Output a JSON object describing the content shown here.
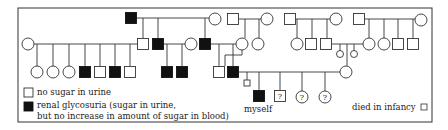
{
  "diagram": {
    "type": "pedigree",
    "trait": "renal glycosuria",
    "colors": {
      "line": "#333333",
      "affected_fill": "#111111",
      "unaffected_fill": "#ffffff",
      "background": "#ffffff"
    },
    "frame": {
      "x": 18,
      "y": 8,
      "width": 414,
      "height": 114
    },
    "symbols": [
      {
        "id": "g1-m1",
        "shape": "square",
        "affected": true,
        "x": 131,
        "y": 18
      },
      {
        "id": "g1-f1",
        "shape": "circle",
        "affected": false,
        "x": 215,
        "y": 19
      },
      {
        "id": "g1-m2",
        "shape": "square",
        "affected": false,
        "x": 233,
        "y": 19
      },
      {
        "id": "g1-f2",
        "shape": "circle",
        "affected": false,
        "x": 267,
        "y": 19
      },
      {
        "id": "g1-m3",
        "shape": "square",
        "affected": false,
        "x": 290,
        "y": 19
      },
      {
        "id": "g1-f3",
        "shape": "circle",
        "affected": false,
        "x": 336,
        "y": 19
      },
      {
        "id": "g1-m4",
        "shape": "square",
        "affected": false,
        "x": 359,
        "y": 19
      },
      {
        "id": "g1-f4",
        "shape": "circle",
        "affected": false,
        "x": 421,
        "y": 20
      },
      {
        "id": "g2-f1",
        "shape": "circle",
        "affected": false,
        "x": 28,
        "y": 44
      },
      {
        "id": "g2-m1",
        "shape": "square",
        "affected": false,
        "x": 143,
        "y": 44
      },
      {
        "id": "g2-m2",
        "shape": "square",
        "affected": true,
        "x": 158,
        "y": 44
      },
      {
        "id": "g2-f2",
        "shape": "circle",
        "affected": false,
        "x": 191,
        "y": 44
      },
      {
        "id": "g2-m3",
        "shape": "square",
        "affected": true,
        "x": 205,
        "y": 44
      },
      {
        "id": "g2-f3",
        "shape": "circle",
        "affected": false,
        "x": 242,
        "y": 44
      },
      {
        "id": "g2-f4",
        "shape": "circle",
        "affected": false,
        "x": 258,
        "y": 44
      },
      {
        "id": "g2-f5",
        "shape": "circle",
        "affected": false,
        "x": 297,
        "y": 44
      },
      {
        "id": "g2-m4",
        "shape": "square",
        "affected": false,
        "x": 311,
        "y": 44
      },
      {
        "id": "g2-m5",
        "shape": "square",
        "affected": false,
        "x": 326,
        "y": 44
      },
      {
        "id": "g2-i1",
        "shape": "circle",
        "affected": false,
        "small": true,
        "x": 340,
        "y": 54
      },
      {
        "id": "g2-i2",
        "shape": "circle",
        "affected": false,
        "small": true,
        "x": 354,
        "y": 54
      },
      {
        "id": "g2-f6",
        "shape": "circle",
        "affected": false,
        "x": 369,
        "y": 44
      },
      {
        "id": "g2-f7",
        "shape": "circle",
        "affected": false,
        "x": 384,
        "y": 44
      },
      {
        "id": "g2-m6",
        "shape": "square",
        "affected": false,
        "x": 398,
        "y": 44
      },
      {
        "id": "g2-m7",
        "shape": "square",
        "affected": false,
        "x": 413,
        "y": 44
      },
      {
        "id": "g3-f1",
        "shape": "circle",
        "affected": false,
        "x": 37,
        "y": 72
      },
      {
        "id": "g3-f2",
        "shape": "circle",
        "affected": false,
        "x": 53,
        "y": 72
      },
      {
        "id": "g3-f3",
        "shape": "circle",
        "affected": false,
        "x": 69,
        "y": 72
      },
      {
        "id": "g3-m1",
        "shape": "square",
        "affected": true,
        "x": 85,
        "y": 72
      },
      {
        "id": "g3-m2",
        "shape": "square",
        "affected": false,
        "x": 100,
        "y": 72
      },
      {
        "id": "g3-m3",
        "shape": "square",
        "affected": true,
        "x": 115,
        "y": 72
      },
      {
        "id": "g3-m4",
        "shape": "square",
        "affected": false,
        "x": 130,
        "y": 72
      },
      {
        "id": "g3-m5",
        "shape": "square",
        "affected": true,
        "x": 167,
        "y": 72
      },
      {
        "id": "g3-m6",
        "shape": "square",
        "affected": true,
        "x": 182,
        "y": 72
      },
      {
        "id": "g3-m7",
        "shape": "square",
        "affected": false,
        "x": 219,
        "y": 72
      },
      {
        "id": "g3-m8",
        "shape": "square",
        "affected": true,
        "x": 233,
        "y": 72
      },
      {
        "id": "g3-f4",
        "shape": "circle",
        "affected": false,
        "x": 346,
        "y": 72
      },
      {
        "id": "g4-i1",
        "shape": "square",
        "affected": false,
        "small": true,
        "x": 247,
        "y": 83
      },
      {
        "id": "g4-self",
        "shape": "square",
        "affected": true,
        "x": 259,
        "y": 96
      },
      {
        "id": "g4-u1",
        "shape": "square",
        "affected": false,
        "unknown": true,
        "x": 280,
        "y": 96
      },
      {
        "id": "g4-u2",
        "shape": "circle",
        "affected": false,
        "unknown": true,
        "x": 302,
        "y": 97
      },
      {
        "id": "g4-u3",
        "shape": "circle",
        "affected": false,
        "unknown": true,
        "x": 325,
        "y": 97
      }
    ],
    "lines": [
      [
        137,
        18,
        209,
        18
      ],
      [
        143,
        18,
        143,
        38
      ],
      [
        158,
        18,
        158,
        38
      ],
      [
        205,
        18,
        205,
        38
      ],
      [
        239,
        19,
        261,
        19
      ],
      [
        245,
        19,
        245,
        38
      ],
      [
        259,
        19,
        259,
        38
      ],
      [
        296,
        19,
        330,
        19
      ],
      [
        297,
        19,
        297,
        38
      ],
      [
        312,
        19,
        312,
        38
      ],
      [
        327,
        19,
        327,
        38
      ],
      [
        365,
        19,
        415,
        19
      ],
      [
        369,
        19,
        369,
        38
      ],
      [
        384,
        19,
        384,
        38
      ],
      [
        398,
        19,
        398,
        38
      ],
      [
        413,
        19,
        413,
        38
      ],
      [
        34,
        44,
        137,
        44
      ],
      [
        37,
        44,
        37,
        66
      ],
      [
        53,
        44,
        53,
        66
      ],
      [
        69,
        44,
        69,
        66
      ],
      [
        85,
        44,
        85,
        66
      ],
      [
        100,
        44,
        100,
        66
      ],
      [
        115,
        44,
        115,
        66
      ],
      [
        130,
        44,
        130,
        66
      ],
      [
        164,
        44,
        185,
        44
      ],
      [
        167,
        44,
        167,
        66
      ],
      [
        182,
        44,
        182,
        66
      ],
      [
        211,
        44,
        236,
        44
      ],
      [
        219,
        44,
        219,
        66
      ],
      [
        233,
        44,
        233,
        66
      ],
      [
        242,
        50,
        242,
        55
      ],
      [
        225,
        55,
        242,
        55
      ],
      [
        225,
        55,
        225,
        66
      ],
      [
        332,
        44,
        363,
        44
      ],
      [
        340,
        44,
        340,
        51
      ],
      [
        354,
        44,
        354,
        51
      ],
      [
        347,
        44,
        347,
        66
      ],
      [
        239,
        72,
        340,
        72
      ],
      [
        247,
        72,
        247,
        80
      ],
      [
        259,
        72,
        259,
        90
      ],
      [
        280,
        72,
        280,
        90
      ],
      [
        302,
        72,
        302,
        91
      ],
      [
        325,
        72,
        325,
        91
      ]
    ],
    "labels": {
      "myself": "myself",
      "unknown_mark": "?",
      "died_in_infancy": "died in infancy"
    },
    "legend": {
      "unaffected_label": "no sugar in urine",
      "affected_label_line1": "renal glycosuria (sugar in urine,",
      "affected_label_line2": "but no increase in amount of sugar in blood)"
    }
  }
}
